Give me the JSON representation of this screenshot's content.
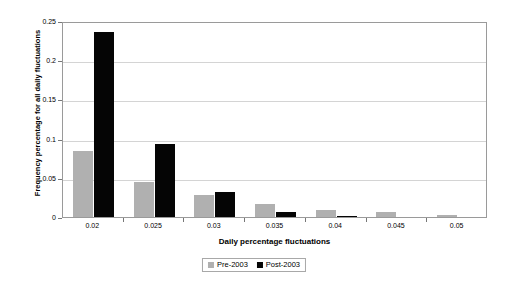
{
  "chart_data": {
    "type": "bar",
    "title": "",
    "xlabel": "Daily percentage fluctuations",
    "ylabel": "Frequency percentage for all daily fluctuations",
    "categories": [
      "0.02",
      "0.025",
      "0.03",
      "0.035",
      "0.04",
      "0.045",
      "0.05"
    ],
    "series": [
      {
        "name": "Pre-2003",
        "color": "#b0b0b0",
        "values": [
          0.084,
          0.045,
          0.028,
          0.016,
          0.009,
          0.006,
          0.003
        ]
      },
      {
        "name": "Post-2003",
        "color": "#050505",
        "values": [
          0.236,
          0.093,
          0.032,
          0.006,
          0.001,
          0.0,
          0.0
        ]
      }
    ],
    "ylim": [
      0,
      0.25
    ],
    "yticks": [
      "0",
      "0.05",
      "0.1",
      "0.15",
      "0.2",
      "0.25"
    ],
    "ytick_values": [
      0,
      0.05,
      0.1,
      0.15,
      0.2,
      0.25
    ],
    "grid": true,
    "legend_position": "bottom"
  },
  "axes": {
    "y_title": "Frequency percentage for all daily fluctuations",
    "x_title": "Daily percentage fluctuations"
  },
  "legend": {
    "items": [
      {
        "label": "Pre-2003"
      },
      {
        "label": "Post-2003"
      }
    ]
  }
}
